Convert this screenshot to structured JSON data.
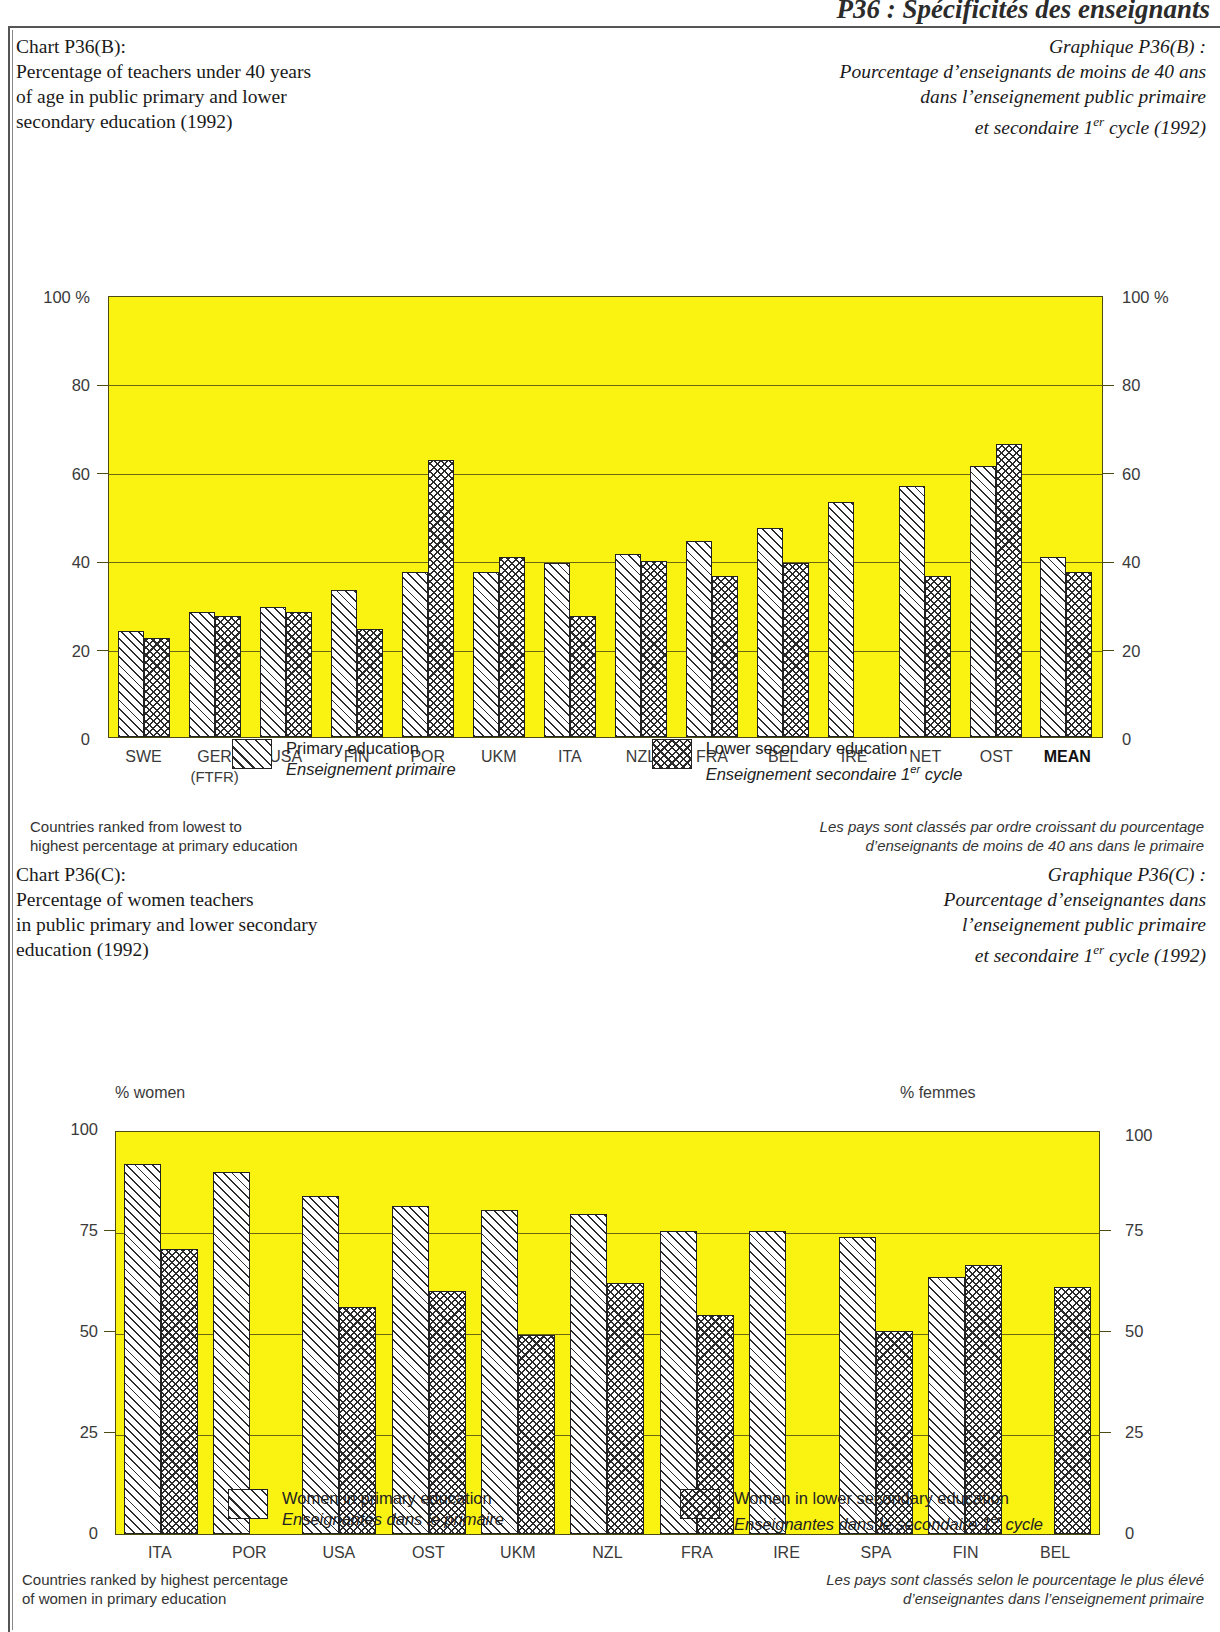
{
  "running_head": "P36 : Spécificités des enseignants",
  "charts": [
    {
      "id": "P36B",
      "title_en": "Chart P36(B):\nPercentage of teachers under 40 years\nof age in public primary and lower\nsecondary education (1992)",
      "title_fr": "Graphique P36(B) :\nPourcentage d’enseignants de moins de 40 ans\ndans l’enseignement public primaire\net secondaire 1er cycle (1992)",
      "legend": [
        {
          "swatch": "primary",
          "en": "Primary education",
          "fr": "Enseignement primaire"
        },
        {
          "swatch": "secondary",
          "en": "Lower secondary education",
          "fr": "Enseignement secondaire 1er cycle"
        }
      ],
      "note_en": "Countries ranked from lowest to\nhighest percentage at primary education",
      "note_fr": "Les pays sont classés par ordre croissant du pourcentage\nd’enseignants de moins de 40 ans dans le primaire",
      "chart_data": {
        "type": "bar",
        "title": "Percentage of teachers under 40 years of age in public primary and lower secondary education (1992)",
        "xlabel": "",
        "ylabel": "100 %",
        "ylabel_right": "100 %",
        "ylim": [
          0,
          100
        ],
        "yticks": [
          0,
          20,
          40,
          60,
          80,
          100
        ],
        "ytick_labels": [
          "0",
          "20",
          "40",
          "60",
          "80",
          "100 %"
        ],
        "grid": true,
        "legend_position": "below",
        "categories": [
          "SWE",
          "GER\n(FTFR)",
          "USA",
          "FIN",
          "POR",
          "UKM",
          "ITA",
          "NZL",
          "FRA",
          "BEL",
          "IRE",
          "NET",
          "OST",
          "MEAN"
        ],
        "series": [
          {
            "name": "Primary education",
            "values": [
              24.0,
              28.5,
              29.5,
              33.5,
              37.5,
              37.5,
              39.5,
              41.5,
              44.5,
              47.5,
              53.5,
              57.0,
              61.5,
              41.0
            ]
          },
          {
            "name": "Lower secondary education",
            "values": [
              22.5,
              27.5,
              28.5,
              24.5,
              63.0,
              41.0,
              27.5,
              40.0,
              36.5,
              39.5,
              null,
              36.5,
              66.5,
              37.5
            ]
          }
        ]
      }
    },
    {
      "id": "P36C",
      "title_en": "Chart P36(C):\nPercentage of women teachers\nin public primary and lower secondary\neducation (1992)",
      "title_fr": "Graphique P36(C) :\nPourcentage d’enseignantes dans\nl’enseignement public primaire\net secondaire 1er cycle (1992)",
      "legend": [
        {
          "swatch": "primary",
          "en": "Women in primary education",
          "fr": "Enseignantes dans le primaire"
        },
        {
          "swatch": "secondary",
          "en": "Women in lower secondary education",
          "fr": "Enseignantes dans le secondaire 1er cycle"
        }
      ],
      "note_en": "Countries ranked by highest percentage\nof women in primary education",
      "note_fr": "Les pays sont classés selon le pourcentage le plus élevé\nd’enseignantes dans l’enseignement primaire",
      "chart_data": {
        "type": "bar",
        "title": "Percentage of women teachers in public primary and lower secondary education (1992)",
        "xlabel": "",
        "ylabel": "% women",
        "ylabel_right": "% femmes",
        "ylim": [
          0,
          100
        ],
        "yticks": [
          0,
          25,
          50,
          75,
          100
        ],
        "ytick_labels": [
          "0",
          "25",
          "50",
          "75",
          "100"
        ],
        "grid": true,
        "legend_position": "below",
        "categories": [
          "ITA",
          "POR",
          "USA",
          "OST",
          "UKM",
          "NZL",
          "FRA",
          "IRE",
          "SPA",
          "FIN",
          "BEL"
        ],
        "series": [
          {
            "name": "Women in primary education",
            "values": [
              92.0,
              90.0,
              84.0,
              81.5,
              80.5,
              79.5,
              75.5,
              75.5,
              74.0,
              64.0,
              null
            ]
          },
          {
            "name": "Women in lower secondary education",
            "values": [
              71.0,
              null,
              56.5,
              60.5,
              49.5,
              62.5,
              54.5,
              null,
              50.5,
              67.0,
              61.5
            ]
          }
        ]
      }
    }
  ]
}
